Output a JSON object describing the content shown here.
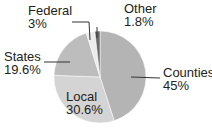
{
  "chart_data": {
    "type": "pie",
    "title": "",
    "categories": [
      "Counties",
      "Local",
      "States",
      "Federal",
      "Other"
    ],
    "values": [
      45,
      30.6,
      19.6,
      3,
      1.8
    ],
    "unit": "%",
    "labels": [
      {
        "name": "Counties",
        "value": "45%"
      },
      {
        "name": "Local",
        "value": "30.6%"
      },
      {
        "name": "States",
        "value": "19.6%"
      },
      {
        "name": "Federal",
        "value": "3%"
      },
      {
        "name": "Other",
        "value": "1.8%"
      }
    ],
    "colors": [
      "#b4b4b4",
      "#d4d4d4",
      "#bdbdbd",
      "#ececec",
      "#6a6a6a"
    ]
  }
}
